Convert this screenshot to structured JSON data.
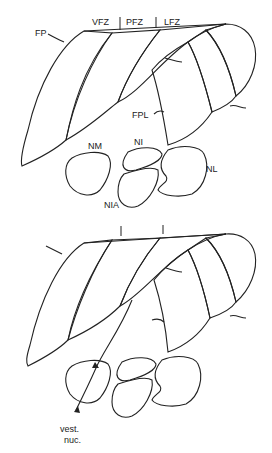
{
  "figure": {
    "top_panel": {
      "labels": {
        "fp": "FP",
        "vfz": "VFZ",
        "pfz": "PFZ",
        "lfz": "LFZ",
        "fpl": "FPL",
        "nm": "NM",
        "ni": "NI",
        "nia": "NIA",
        "nl": "NL"
      }
    },
    "bottom_panel": {
      "labels": {
        "vest_line1": "vest.",
        "vest_line2": "nuc."
      }
    },
    "patterns": {
      "fine_dot": "FP / FPL / NM region",
      "hatch": "VFZ / LFZ / NI / NIA region",
      "coarse_dot": "PFZ / NL region"
    },
    "colors": {
      "ink": "#222222",
      "background": "#ffffff",
      "fine_dot": "#b8b8b8"
    }
  }
}
